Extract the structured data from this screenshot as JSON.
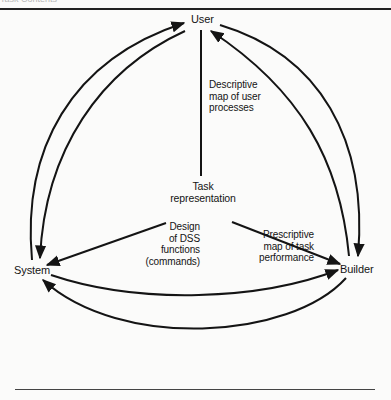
{
  "header": {
    "caption": "Task Contents"
  },
  "nodes": {
    "user": "User",
    "system": "System",
    "builder": "Builder",
    "center_line1": "Task",
    "center_line2": "representation"
  },
  "edge_labels": {
    "descriptive": "Descriptive\nmap of user\nprocesses",
    "design": "Design\nof DSS\nfunctions\n(commands)",
    "prescriptive": "Prescriptive\nmap of task\nperformance"
  },
  "colors": {
    "ink": "#141414",
    "paper": "#fbfbfa"
  }
}
